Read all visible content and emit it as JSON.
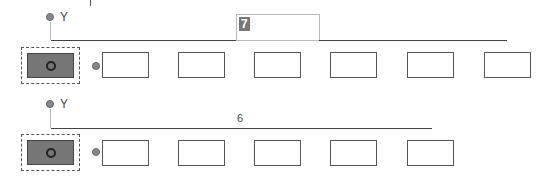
{
  "rows": [
    {
      "y_label": "Y",
      "x_label": "X",
      "value": "7",
      "value_editing": true,
      "box_count": 6
    },
    {
      "y_label": "Y",
      "x_label": "X",
      "value": "6",
      "value_editing": false,
      "box_count": 5
    }
  ]
}
